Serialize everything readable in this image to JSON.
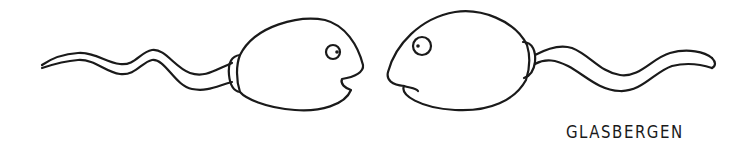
{
  "cartoon": {
    "description": "Two sperm cartoon characters facing each other",
    "characters": [
      {
        "id": "left-sperm",
        "facing": "right",
        "mouth": "open"
      },
      {
        "id": "right-sperm",
        "facing": "left",
        "mouth": "closed"
      }
    ],
    "signature": "GLASBERGEN",
    "colors": {
      "ink": "#1a1a1a",
      "background": "#ffffff"
    }
  }
}
